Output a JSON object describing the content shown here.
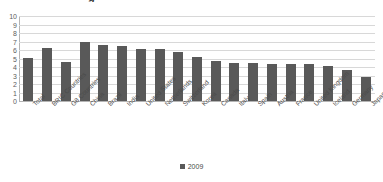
{
  "chart_data": {
    "type": "bar",
    "title": "",
    "title_clipped_remnant": "g",
    "xlabel": "",
    "ylabel": "",
    "ylim": [
      0,
      10
    ],
    "ytick_step": 1,
    "ytick_labels": [
      "10",
      "9",
      "8",
      "7",
      "6",
      "5",
      "4",
      "3",
      "2",
      "1",
      "0"
    ],
    "grid": true,
    "grid_axis": "y",
    "legend_position": "bottom",
    "bar_color": "#595959",
    "categories": [
      "Total",
      "BRIC Countries",
      "G8 Countries",
      "China",
      "Brazil",
      "India",
      "United States",
      "Netherlands",
      "Switzerland",
      "Korea",
      "Canada",
      "Italy",
      "Spain",
      "Austria",
      "France",
      "United Kingdom",
      "Iceland",
      "Germany",
      "Japan"
    ],
    "series": [
      {
        "name": "2009",
        "color": "#595959",
        "values": [
          5.1,
          6.2,
          4.55,
          6.95,
          6.6,
          6.45,
          6.15,
          6.1,
          5.8,
          5.15,
          4.65,
          4.5,
          4.5,
          4.4,
          4.4,
          4.3,
          4.1,
          3.7,
          2.8
        ]
      }
    ]
  },
  "legend": {
    "entries": [
      {
        "label": "2009",
        "color": "#595959"
      }
    ]
  }
}
